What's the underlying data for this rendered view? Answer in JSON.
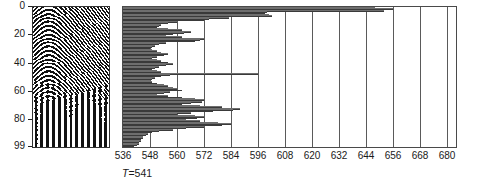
{
  "figure": {
    "title": "",
    "panels": [
      "seismic-variable-density",
      "horizontal-bar-chart"
    ]
  },
  "left_panel": {
    "name": "seismic-section",
    "ylabel": "",
    "yticks": [
      0,
      20,
      40,
      60,
      80,
      99
    ],
    "ytick_labels": [
      "0",
      "20",
      "40",
      "60",
      "80",
      "99"
    ],
    "ylim": [
      0,
      99
    ],
    "trace_count": 40,
    "colors": {
      "ink": "#111111",
      "paper": "#ffffff",
      "frame": "#333333"
    }
  },
  "annotation": {
    "t_prefix": "T",
    "t_equals": "=",
    "t_value": "541",
    "t_text": "T = 541"
  },
  "chart_data": {
    "type": "bar",
    "orientation": "horizontal",
    "title": "",
    "xlabel": "",
    "ylabel": "",
    "xlim": [
      536,
      684
    ],
    "ylim": [
      0,
      99
    ],
    "grid": true,
    "legend": null,
    "xticks": [
      536,
      548,
      560,
      572,
      584,
      596,
      608,
      620,
      632,
      644,
      656,
      668,
      680
    ],
    "xtick_labels": [
      "536",
      "548",
      "560",
      "572",
      "584",
      "596",
      "608",
      "620",
      "632",
      "644",
      "656",
      "668",
      "680"
    ],
    "baseline": 536,
    "bar_color": "#6e6e6e",
    "categories": [
      0,
      1,
      2,
      3,
      4,
      5,
      6,
      7,
      8,
      9,
      10,
      11,
      12,
      13,
      14,
      15,
      16,
      17,
      18,
      19,
      20,
      21,
      22,
      23,
      24,
      25,
      26,
      27,
      28,
      29,
      30,
      31,
      32,
      33,
      34,
      35,
      36,
      37,
      38,
      39,
      40,
      41,
      42,
      43,
      44,
      45,
      46,
      47,
      48,
      49,
      50,
      51,
      52,
      53,
      54,
      55,
      56,
      57,
      58,
      59,
      60,
      61,
      62,
      63,
      64,
      65,
      66,
      67,
      68,
      69,
      70,
      71,
      72,
      73,
      74,
      75,
      76,
      77,
      78,
      79,
      80,
      81,
      82,
      83,
      84,
      85,
      86,
      87,
      88,
      89,
      90,
      91,
      92,
      93,
      94,
      95,
      96,
      97,
      98,
      99
    ],
    "values": [
      648,
      656,
      652,
      600,
      599,
      601,
      602,
      583,
      574,
      572,
      560,
      556,
      553,
      552,
      551,
      556,
      562,
      566,
      563,
      558,
      555,
      562,
      572,
      570,
      568,
      555,
      552,
      550,
      549,
      548,
      549,
      551,
      553,
      556,
      554,
      551,
      549,
      551,
      553,
      556,
      558,
      555,
      552,
      550,
      549,
      551,
      553,
      596,
      557,
      553,
      550,
      549,
      548,
      549,
      551,
      554,
      556,
      558,
      560,
      562,
      557,
      554,
      551,
      556,
      562,
      568,
      572,
      571,
      566,
      562,
      570,
      580,
      588,
      585,
      576,
      566,
      560,
      568,
      572,
      569,
      564,
      570,
      578,
      584,
      580,
      572,
      564,
      558,
      552,
      549,
      547,
      546,
      545,
      545,
      544,
      544,
      543,
      543,
      542,
      541
    ]
  }
}
